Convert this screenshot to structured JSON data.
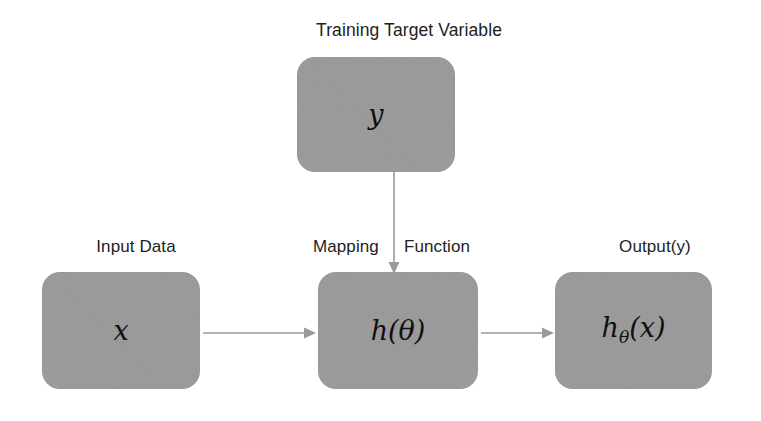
{
  "diagram": {
    "title": "Training Target Variable",
    "accent_gray": "#9d9d9d",
    "arrow_gray": "#9a9a9a",
    "text_color": "#1d1d1d",
    "nodes": [
      {
        "id": "target",
        "math": "y",
        "label": "Training Target Variable"
      },
      {
        "id": "input",
        "math": "x",
        "label": "Input Data"
      },
      {
        "id": "model",
        "math": "h(θ)",
        "label_left": "Mapping",
        "label_right": "Function"
      },
      {
        "id": "output",
        "math_base": "h",
        "math_sub": "θ",
        "math_arg": "(x)",
        "label": "Output(y)"
      }
    ],
    "labels": {
      "input_data": "Input Data",
      "mapping": "Mapping",
      "function": "Function",
      "output": "Output(y)"
    },
    "arrows": [
      {
        "id": "target-to-model",
        "from": "target",
        "to": "model",
        "direction": "down"
      },
      {
        "id": "input-to-model",
        "from": "input",
        "to": "model",
        "direction": "right"
      },
      {
        "id": "model-to-output",
        "from": "model",
        "to": "output",
        "direction": "right"
      }
    ]
  }
}
